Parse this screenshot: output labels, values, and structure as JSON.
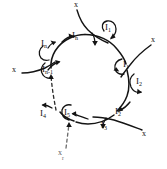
{
  "figure": {
    "background_color": "#ffffff",
    "ink_color": "#141414",
    "faint_ink_color": "#5d5d5d",
    "width": 167,
    "height": 169
  },
  "nodes": [
    {
      "id": "node-in-top",
      "base": "I",
      "sub": "n",
      "text": "In",
      "x": 76,
      "y": 36
    },
    {
      "id": "node-in-left",
      "base": "I",
      "sub": "n",
      "text": "In",
      "x": 45,
      "y": 44
    },
    {
      "id": "node-in-minus-1",
      "base": "I",
      "sub": "n-1",
      "text": "In-1",
      "x": 46,
      "y": 70
    },
    {
      "id": "node-i4",
      "base": "I",
      "sub": "4",
      "text": "I4",
      "x": 44,
      "y": 114
    },
    {
      "id": "node-i5",
      "base": "I",
      "sub": "5",
      "text": "I5",
      "x": 67,
      "y": 113
    },
    {
      "id": "node-i3",
      "base": "I",
      "sub": "3",
      "text": "I3",
      "x": 104,
      "y": 126
    },
    {
      "id": "node-i2-lower",
      "base": "I",
      "sub": "2",
      "text": "I2",
      "x": 118,
      "y": 112
    },
    {
      "id": "node-i2-right",
      "base": "I",
      "sub": "2",
      "text": "I2",
      "x": 139,
      "y": 82
    },
    {
      "id": "node-i1-right",
      "base": "I",
      "sub": "1",
      "text": "I1",
      "x": 126,
      "y": 65
    },
    {
      "id": "node-i1-top",
      "base": "I",
      "sub": "1",
      "text": "I1",
      "x": 108,
      "y": 28
    }
  ],
  "substrates": [
    {
      "id": "x-top",
      "text": "x",
      "sub": "",
      "x": 76,
      "y": 3,
      "faint": false
    },
    {
      "id": "x-right-upper",
      "text": "x",
      "sub": "",
      "x": 153,
      "y": 40,
      "faint": false
    },
    {
      "id": "x-left",
      "text": "x",
      "sub": "",
      "x": 14,
      "y": 70,
      "faint": false
    },
    {
      "id": "x-right-lower",
      "text": "x",
      "sub": "",
      "x": 144,
      "y": 134,
      "faint": false
    },
    {
      "id": "x-bottom",
      "text": "x",
      "sub": "r",
      "x": 61,
      "y": 153,
      "faint": true
    }
  ],
  "ring": {
    "center_x": 84,
    "center_y": 82,
    "radius_x": 42,
    "radius_y": 44,
    "style": "hand-drawn closed loop"
  },
  "legend": {
    "note": ""
  }
}
